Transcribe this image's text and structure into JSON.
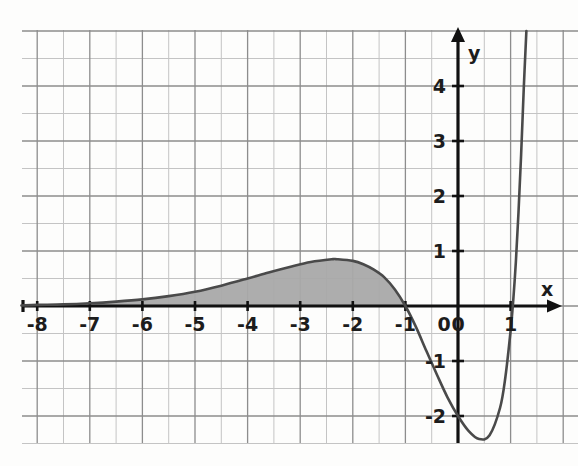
{
  "chart_data": {
    "type": "line",
    "title": "",
    "xlabel": "x",
    "ylabel": "y",
    "grid": true,
    "legend": null,
    "xlim": [
      -8.3,
      2.3
    ],
    "ylim": [
      -2.9,
      4.9
    ],
    "x_ticks": [
      -8,
      -7,
      -6,
      -5,
      -4,
      -3,
      -2,
      -1,
      0,
      1
    ],
    "x_tick_labels": [
      "-8",
      "-7",
      "-6",
      "-5",
      "-4",
      "-3",
      "-2",
      "-1",
      "0",
      "1"
    ],
    "y_ticks": [
      -2,
      -1,
      0,
      1,
      2,
      3,
      4
    ],
    "y_tick_labels": [
      "-2",
      "-1",
      "0",
      "1",
      "2",
      "3",
      "4"
    ],
    "minor_grid_step": 0.5,
    "major_grid_step": 1,
    "annotations": [
      {
        "name": "local-maximum",
        "x": -2.3,
        "y": 0.85
      },
      {
        "name": "local-minimum",
        "x": 0.4,
        "y": -2.45
      },
      {
        "name": "left-x-intercept",
        "x": -1,
        "y": 0
      },
      {
        "name": "right-x-intercept",
        "x": 1.05,
        "y": 0
      },
      {
        "name": "y-intercept",
        "x": 0,
        "y": -2
      }
    ],
    "shaded_region": {
      "label": "area under curve",
      "x_from": -8,
      "x_to": -1,
      "bounded_below_by": "x-axis",
      "fill_color": "#a9a9a9"
    },
    "series": [
      {
        "name": "curve",
        "color": "#4a4a4a",
        "x": [
          -8.3,
          -8.0,
          -7.5,
          -7.0,
          -6.5,
          -6.0,
          -5.5,
          -5.0,
          -4.5,
          -4.0,
          -3.6,
          -3.2,
          -2.8,
          -2.4,
          -2.3,
          -2.0,
          -1.8,
          -1.6,
          -1.4,
          -1.2,
          -1.0,
          -0.8,
          -0.6,
          -0.4,
          -0.2,
          0.0,
          0.2,
          0.4,
          0.6,
          0.8,
          0.9,
          1.0,
          1.05,
          1.1,
          1.15,
          1.2,
          1.25,
          1.3
        ],
        "y": [
          0.01,
          0.02,
          0.03,
          0.05,
          0.08,
          0.12,
          0.18,
          0.26,
          0.37,
          0.5,
          0.61,
          0.71,
          0.8,
          0.85,
          0.85,
          0.82,
          0.76,
          0.66,
          0.52,
          0.3,
          0.0,
          -0.38,
          -0.82,
          -1.25,
          -1.66,
          -2.0,
          -2.27,
          -2.42,
          -2.35,
          -1.85,
          -1.3,
          -0.45,
          0.1,
          0.8,
          1.7,
          2.75,
          3.95,
          5.0
        ]
      }
    ]
  },
  "axes": {
    "x_axis_label": "x",
    "y_axis_label": "y"
  }
}
